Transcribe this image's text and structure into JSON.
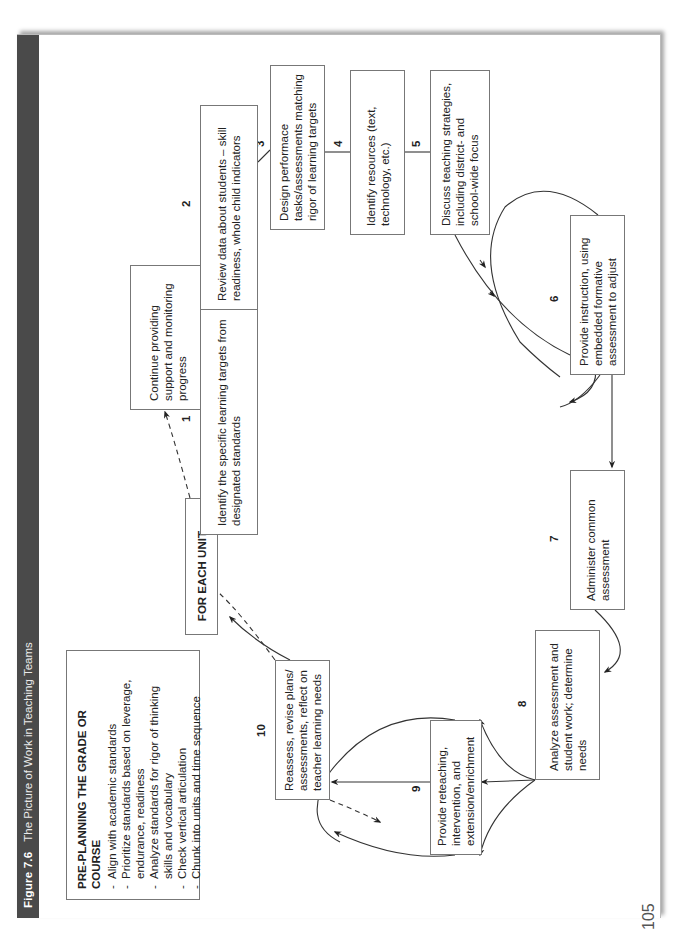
{
  "figure": {
    "number": "Figure 7.6",
    "title": "The Picture of Work in Teaching Teams",
    "header_color": "#4a4a4a"
  },
  "preplanning": {
    "title": "PRE-PLANNING THE GRADE OR COURSE",
    "items": [
      "Align with academic standards",
      "Prioritize standards based on leverage, endurance, readiness",
      "Analyze standards for rigor of thinking skills and vocabulary",
      "Check vertical articulation",
      "Chunk into units and time sequence"
    ]
  },
  "for_each_unit": "FOR EACH UNIT . . .",
  "continue_box": "Continue providing support and monitoring progress",
  "steps": [
    {
      "number": "1",
      "text": "Identify the specific learning targets from designated standards"
    },
    {
      "number": "2",
      "text": "Review data about students – skill readiness, whole child indicators"
    },
    {
      "number": "3",
      "text": "Design performace tasks/assessments matching rigor of learning targets"
    },
    {
      "number": "4",
      "text": "Identify resources (text, technology, etc.)"
    },
    {
      "number": "5",
      "text": "Discuss teaching strategies, including district- and school-wide focus"
    },
    {
      "number": "6",
      "text": "Provide instruction, using embedded formative assessment to adjust"
    },
    {
      "number": "7",
      "text": "Administer common assessment"
    },
    {
      "number": "8",
      "text": "Analyze assessment and student work; determine needs"
    },
    {
      "number": "9",
      "text": "Provide reteaching, intervention, and extension/enrichment"
    },
    {
      "number": "10",
      "text": "Reassess, revise plans/ assessments, reflect on teacher learning needs"
    }
  ],
  "page_number": "105"
}
